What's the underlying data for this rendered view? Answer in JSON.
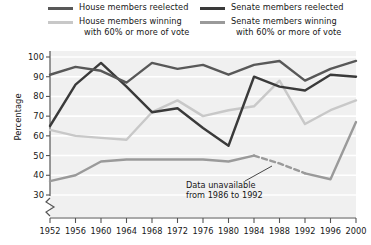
{
  "legend": {
    "items": [
      {
        "label": "House members reelected",
        "label2": "",
        "color": "#585858",
        "key": "house_reelected"
      },
      {
        "label": "Senate members reelected",
        "label2": "",
        "color": "#3a3a3a",
        "key": "senate_reelected"
      },
      {
        "label": "House members winning",
        "label2": "with 60% or more of vote",
        "color": "#c8c8c8",
        "key": "house_60"
      },
      {
        "label": "Senate members winning",
        "label2": "with 60% or more of vote",
        "color": "#9a9a9a",
        "key": "senate_60"
      }
    ]
  },
  "axis": {
    "ylabel": "Percentage",
    "yticks": [
      "100",
      "90",
      "80",
      "70",
      "60",
      "50",
      "40",
      "30"
    ],
    "xticks": [
      "1952",
      "1956",
      "1960",
      "1964",
      "1968",
      "1972",
      "1976",
      "1980",
      "1984",
      "1988",
      "1992",
      "1996",
      "2000"
    ]
  },
  "annotation": {
    "line1": "Data unavailable",
    "line2": "from 1986 to 1992"
  },
  "chart_data": {
    "type": "line",
    "title": "",
    "xlabel": "",
    "ylabel": "Percentage",
    "x": [
      1952,
      1956,
      1960,
      1964,
      1968,
      1972,
      1976,
      1980,
      1984,
      1988,
      1992,
      1996,
      2000
    ],
    "xlim": [
      1952,
      2000
    ],
    "ylim": [
      28,
      100
    ],
    "yticks": [
      30,
      40,
      50,
      60,
      70,
      80,
      90,
      100
    ],
    "grid": "horizontal",
    "axis_break": "y-axis break below 30",
    "legend_position": "top",
    "background": "#f0f0f0",
    "gridline_color": "#ffffff",
    "series": [
      {
        "name": "House members reelected",
        "color": "#585858",
        "values": [
          91,
          95,
          93,
          87,
          97,
          94,
          96,
          91,
          96,
          98,
          88,
          94,
          98
        ]
      },
      {
        "name": "Senate members reelected",
        "color": "#3a3a3a",
        "values": [
          65,
          86,
          97,
          85,
          72,
          74,
          64,
          55,
          90,
          85,
          83,
          91,
          90
        ]
      },
      {
        "name": "House members winning with 60% or more of vote",
        "color": "#c8c8c8",
        "values": [
          63,
          60,
          59,
          58,
          72,
          78,
          70,
          73,
          75,
          88,
          66,
          73,
          78
        ]
      },
      {
        "name": "Senate members winning with 60% or more of vote",
        "color": "#9a9a9a",
        "values": [
          37,
          40,
          47,
          48,
          48,
          48,
          48,
          47,
          50,
          46,
          41,
          38,
          67
        ],
        "dashed_segment": {
          "from": 1984,
          "to": 1992,
          "note": "Data unavailable from 1986 to 1992"
        }
      }
    ]
  }
}
